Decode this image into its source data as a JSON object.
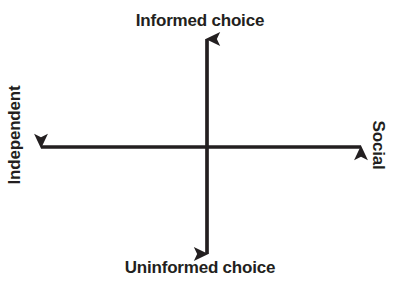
{
  "diagram": {
    "type": "two-axis-cross",
    "background_color": "#ffffff",
    "stroke_color": "#231f20",
    "text_color": "#231f20",
    "stroke_width": 3,
    "center": {
      "x": 207,
      "y": 147
    },
    "axes": {
      "vertical": {
        "top_tip_y": 38,
        "bottom_tip_y": 255,
        "x": 207,
        "top_label": "Informed choice",
        "bottom_label": "Uninformed choice"
      },
      "horizontal": {
        "left_tip_x": 40,
        "right_tip_x": 362,
        "y": 147,
        "left_label": "Independent",
        "right_label": "Social"
      }
    },
    "labels": {
      "top": "Informed choice",
      "bottom": "Uninformed choice",
      "left": "Independent",
      "right": "Social"
    }
  }
}
